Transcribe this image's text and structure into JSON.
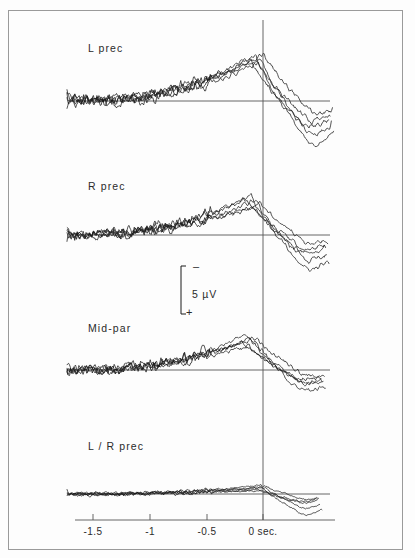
{
  "figure": {
    "kind": "erp-waveform-figure",
    "background_color": "#fdfdfd",
    "frame_color": "#9a9a9a",
    "ink_color": "#1a1a1a",
    "axis_color": "#555555"
  },
  "panels": [
    {
      "label": "L  prec",
      "label_x": 88,
      "label_y": 42,
      "baseline_y": 101
    },
    {
      "label": "R  prec",
      "label_x": 88,
      "label_y": 180,
      "baseline_y": 235
    },
    {
      "label": "Mid-par",
      "label_x": 88,
      "label_y": 322,
      "baseline_y": 370
    },
    {
      "label": "L / R  prec",
      "label_x": 88,
      "label_y": 440,
      "baseline_y": 494
    }
  ],
  "calibration": {
    "value_label": "5 µV",
    "negative_sign": "–",
    "positive_sign": "+",
    "bar_x": 181,
    "bar_top_y": 266,
    "bar_bottom_y": 314,
    "text_x": 192,
    "text_y": 295
  },
  "time_axis": {
    "unit_label": "sec.",
    "axis_y": 520,
    "axis_x_start": 75,
    "axis_x_end": 335,
    "zero_line_x": 263,
    "zero_line_top_y": 20,
    "zero_line_bottom_y": 520,
    "ticks": [
      {
        "label": "-1.5",
        "value": -1.5,
        "x": 93
      },
      {
        "label": "-1",
        "value": -1.0,
        "x": 150
      },
      {
        "label": "-0.5",
        "value": -0.5,
        "x": 207
      },
      {
        "label": "0 sec.",
        "value": 0.0,
        "x": 263
      }
    ],
    "tick_label_y": 526
  },
  "chart_data": {
    "type": "line",
    "title": "",
    "xlabel": "sec.",
    "ylabel": "5 µV",
    "xlim": [
      -1.75,
      0.65
    ],
    "grid": false,
    "legend": "none",
    "channels": [
      {
        "name": "L  prec",
        "n_traces": 5,
        "baseline_y": 101,
        "amplitude_scale": 46,
        "series": [
          {
            "name": "trace-1",
            "seed": 11,
            "peak_x": -0.06,
            "peak_amp": 1.0,
            "after_dip": -1.05,
            "end_x": 0.62
          },
          {
            "name": "trace-2",
            "seed": 23,
            "peak_x": -0.02,
            "peak_amp": 0.94,
            "after_dip": -0.8,
            "end_x": 0.6
          },
          {
            "name": "trace-3",
            "seed": 37,
            "peak_x": -0.1,
            "peak_amp": 0.88,
            "after_dip": -0.62,
            "end_x": 0.58
          },
          {
            "name": "trace-4",
            "seed": 51,
            "peak_x": 0.01,
            "peak_amp": 1.05,
            "after_dip": -0.3,
            "end_x": 0.61
          },
          {
            "name": "trace-5",
            "seed": 67,
            "peak_x": -0.04,
            "peak_amp": 0.8,
            "after_dip": -0.45,
            "end_x": 0.59
          }
        ]
      },
      {
        "name": "R  prec",
        "n_traces": 5,
        "baseline_y": 235,
        "amplitude_scale": 40,
        "series": [
          {
            "name": "trace-1",
            "seed": 13,
            "peak_x": -0.1,
            "peak_amp": 0.98,
            "after_dip": -0.95,
            "end_x": 0.58
          },
          {
            "name": "trace-2",
            "seed": 29,
            "peak_x": -0.06,
            "peak_amp": 0.86,
            "after_dip": -0.7,
            "end_x": 0.56
          },
          {
            "name": "trace-3",
            "seed": 41,
            "peak_x": -0.14,
            "peak_amp": 0.9,
            "after_dip": -0.5,
            "end_x": 0.55
          },
          {
            "name": "trace-4",
            "seed": 59,
            "peak_x": -0.02,
            "peak_amp": 0.78,
            "after_dip": -0.25,
            "end_x": 0.57
          },
          {
            "name": "trace-5",
            "seed": 73,
            "peak_x": -0.08,
            "peak_amp": 0.7,
            "after_dip": -0.38,
            "end_x": 0.54
          }
        ]
      },
      {
        "name": "Mid-par",
        "n_traces": 5,
        "baseline_y": 370,
        "amplitude_scale": 38,
        "series": [
          {
            "name": "trace-1",
            "seed": 17,
            "peak_x": -0.14,
            "peak_amp": 0.95,
            "after_dip": -0.6,
            "end_x": 0.55
          },
          {
            "name": "trace-2",
            "seed": 31,
            "peak_x": -0.1,
            "peak_amp": 0.82,
            "after_dip": -0.42,
            "end_x": 0.53
          },
          {
            "name": "trace-3",
            "seed": 43,
            "peak_x": -0.18,
            "peak_amp": 0.74,
            "after_dip": -0.28,
            "end_x": 0.52
          },
          {
            "name": "trace-4",
            "seed": 61,
            "peak_x": -0.06,
            "peak_amp": 0.88,
            "after_dip": -0.18,
            "end_x": 0.54
          },
          {
            "name": "trace-5",
            "seed": 79,
            "peak_x": -0.12,
            "peak_amp": 0.64,
            "after_dip": -0.35,
            "end_x": 0.51
          }
        ]
      },
      {
        "name": "L / R  prec",
        "n_traces": 5,
        "baseline_y": 494,
        "amplitude_scale": 16,
        "series": [
          {
            "name": "trace-1",
            "seed": 19,
            "peak_x": -0.02,
            "peak_amp": 0.55,
            "after_dip": -1.4,
            "end_x": 0.52
          },
          {
            "name": "trace-2",
            "seed": 33,
            "peak_x": 0.02,
            "peak_amp": 0.4,
            "after_dip": -0.95,
            "end_x": 0.5
          },
          {
            "name": "trace-3",
            "seed": 47,
            "peak_x": -0.04,
            "peak_amp": 0.3,
            "after_dip": -0.6,
            "end_x": 0.48
          },
          {
            "name": "trace-4",
            "seed": 63,
            "peak_x": 0.04,
            "peak_amp": 0.45,
            "after_dip": -0.35,
            "end_x": 0.49
          },
          {
            "name": "trace-5",
            "seed": 83,
            "peak_x": 0.0,
            "peak_amp": 0.22,
            "after_dip": -0.5,
            "end_x": 0.47
          }
        ]
      }
    ]
  }
}
